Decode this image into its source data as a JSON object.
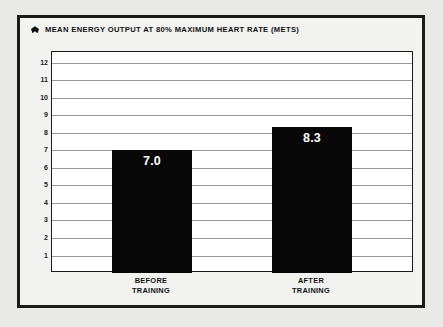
{
  "figure": {
    "title": "MEAN ENERGY OUTPUT AT 80% MAXIMUM HEART RATE (METS)",
    "bullet_icon": "diamond-bullet-icon",
    "frame_color": "#1a1a1a",
    "plot_background": "#ffffff",
    "page_background": "#e9e9e7",
    "bar_color": "#080808",
    "gridline_color": "#9a9a9a",
    "value_label_color": "#ffffff"
  },
  "chart_data": {
    "type": "bar",
    "title": "MEAN ENERGY OUTPUT AT 80% MAXIMUM HEART RATE (METS)",
    "categories": [
      "BEFORE TRAINING",
      "AFTER TRAINING"
    ],
    "category_lines": [
      [
        "BEFORE",
        "TRAINING"
      ],
      [
        "AFTER",
        "TRAINING"
      ]
    ],
    "values": [
      7.0,
      8.3
    ],
    "value_labels": [
      "7.0",
      "8.3"
    ],
    "xlabel": "",
    "ylabel": "",
    "ylim": [
      0,
      12.6
    ],
    "yticks": [
      1,
      2,
      3,
      4,
      5,
      6,
      7,
      8,
      9,
      10,
      11,
      12
    ],
    "ytick_labels": [
      "1",
      "2",
      "3",
      "4",
      "5",
      "6",
      "7",
      "8",
      "9",
      "10",
      "11",
      "12"
    ],
    "grid": true,
    "grid_axis": "y",
    "legend": false,
    "units": "METS"
  }
}
